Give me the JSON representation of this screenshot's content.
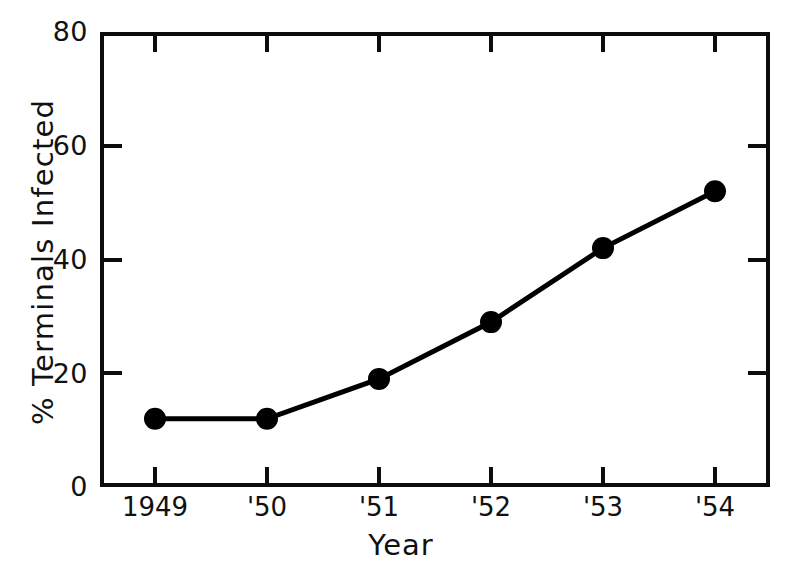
{
  "chart_data": {
    "type": "line",
    "title": "",
    "subtitle": "",
    "xlabel": "Year",
    "ylabel": "% Terminals Infected",
    "categories": [
      "1949",
      "'50",
      "'51",
      "'52",
      "'53",
      "'54"
    ],
    "x": [
      1949,
      1950,
      1951,
      1952,
      1953,
      1954
    ],
    "values": [
      12,
      12,
      19,
      29,
      42,
      52
    ],
    "series": [
      {
        "name": "% Terminals Infected",
        "values": [
          12,
          12,
          19,
          29,
          42,
          52
        ]
      }
    ],
    "ylim": [
      0,
      80
    ],
    "yticks": [
      0,
      20,
      40,
      60,
      80
    ],
    "ytick_labels": [
      "0",
      "20",
      "40",
      "60",
      "80"
    ],
    "xtick_labels": [
      "1949",
      "'50",
      "'51",
      "'52",
      "'53",
      "'54"
    ],
    "grid": false,
    "legend": false,
    "legend_position": "none",
    "marker": "filled-circle",
    "line_color": "#000000",
    "marker_color": "#000000",
    "background_color": "#ffffff",
    "frame": "box-all-sides",
    "tick_direction": "in",
    "annotations": []
  }
}
